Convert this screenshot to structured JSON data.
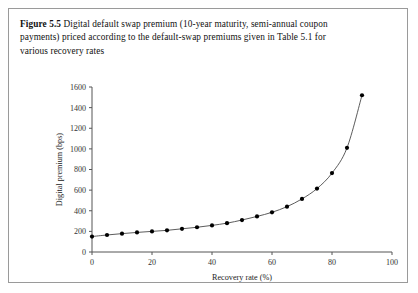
{
  "figure": {
    "label": "Figure 5.5",
    "caption": "Digital default swap premium (10-year maturity, semi-annual coupon payments) priced according to the default-swap premiums given in Table 5.1 for various recovery rates"
  },
  "colors": {
    "border": "#9a9a9a",
    "axis": "#555555",
    "line": "#4a4a4a",
    "marker": "#000000",
    "background": "#ffffff",
    "text": "#111111"
  },
  "chart_data": {
    "type": "line",
    "title": "",
    "xlabel": "Recovery rate (%)",
    "ylabel": "Digital premium (bps)",
    "xlim": [
      0,
      100
    ],
    "ylim": [
      0,
      1600
    ],
    "xticks": [
      0,
      20,
      40,
      60,
      80,
      100
    ],
    "xtick_labels": [
      "0",
      "20",
      "40",
      "60",
      "80",
      "100"
    ],
    "yticks": [
      0,
      200,
      400,
      600,
      800,
      1000,
      1200,
      1400,
      1600
    ],
    "ytick_labels": [
      "0",
      "200",
      "400",
      "600",
      "800",
      "1000",
      "1200",
      "1400",
      "1600"
    ],
    "grid": false,
    "legend": null,
    "markers": "filled-circle",
    "x": [
      0,
      5,
      10,
      15,
      20,
      25,
      30,
      35,
      40,
      45,
      50,
      55,
      60,
      65,
      70,
      75,
      80,
      85,
      90
    ],
    "values": [
      150,
      165,
      178,
      190,
      200,
      210,
      225,
      240,
      258,
      280,
      310,
      345,
      385,
      440,
      515,
      615,
      765,
      1010,
      1520
    ],
    "series": [
      {
        "name": "Digital premium",
        "x": [
          0,
          5,
          10,
          15,
          20,
          25,
          30,
          35,
          40,
          45,
          50,
          55,
          60,
          65,
          70,
          75,
          80,
          85,
          90
        ],
        "values": [
          150,
          165,
          178,
          190,
          200,
          210,
          225,
          240,
          258,
          280,
          310,
          345,
          385,
          440,
          515,
          615,
          765,
          1010,
          1520
        ]
      }
    ]
  }
}
